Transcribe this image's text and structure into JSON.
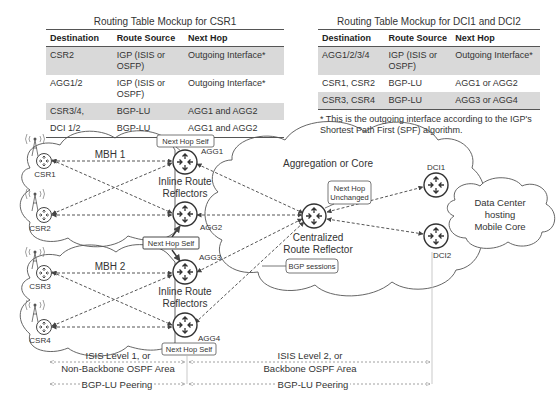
{
  "tables": [
    {
      "title": "Routing Table Mockup for CSR1",
      "headers": [
        "Destination",
        "Route Source",
        "Next Hop"
      ],
      "rows": [
        {
          "dest": "CSR2",
          "src": "IGP (ISIS or OSFP)",
          "hop": "Outgoing Interface*",
          "shaded": true
        },
        {
          "dest": "AGG1/2",
          "src": "IGP (ISIS or OSPF)",
          "hop": "Outgoing Interface*",
          "shaded": false
        },
        {
          "dest": "CSR3/4,",
          "src": "BGP-LU",
          "hop": "AGG1 and AGG2",
          "shaded": true
        },
        {
          "dest": "DCI 1/2",
          "src": "BGP-LU",
          "hop": "AGG1 and AGG2",
          "shaded": false
        }
      ]
    },
    {
      "title": "Routing Table Mockup for DCI1 and DCI2",
      "headers": [
        "Destination",
        "Route Source",
        "Next Hop"
      ],
      "rows": [
        {
          "dest": "AGG1/2/3/4",
          "src": "IGP (ISIS or OSPF)",
          "hop": "Outgoing Interface*",
          "shaded": true
        },
        {
          "dest": "CSR1, CSR2",
          "src": "BGP-LU",
          "hop": "AGG1 or AGG2",
          "shaded": false
        },
        {
          "dest": "CSR3, CSR4",
          "src": "BGP-LU",
          "hop": "AGG3 or AGG4",
          "shaded": true
        }
      ],
      "footnote": "* This is the outgoing interface according to the IGP's Shortest Path First (SPF) algorithm."
    }
  ],
  "diagram": {
    "clouds": {
      "mbh1": "MBH 1",
      "mbh2": "MBH 2",
      "core": "Aggregation or Core",
      "dc_line1": "Data Center",
      "dc_line2": "hosting",
      "dc_line3": "Mobile Core"
    },
    "nodes": {
      "csr1": "CSR1",
      "csr2": "CSR2",
      "csr3": "CSR3",
      "csr4": "CSR4",
      "agg1": "AGG1",
      "agg2": "AGG2",
      "agg3": "AGG3",
      "agg4": "AGG4",
      "dci1": "DCI1",
      "dci2": "DCI2"
    },
    "labels": {
      "inline_rr_top_1": "Inline Route",
      "inline_rr_top_2": "Reflectors",
      "inline_rr_bot_1": "Inline Route",
      "inline_rr_bot_2": "Reflectors",
      "central_rr_1": "Centralized",
      "central_rr_2": "Route Reflector"
    },
    "callouts": {
      "nhs_agg1": "Next Hop Self",
      "nhs_agg23": "Next Hop Self",
      "nhs_agg4": "Next Hop Self",
      "nh_unchanged_1": "Next Hop",
      "nh_unchanged_2": "Unchanged",
      "bgp_sessions": "BGP sessions"
    },
    "spans": {
      "isis_l1_line1": "ISIS Level 1, or",
      "isis_l1_line2": "Non-Backbone OSPF Area",
      "isis_l2_line1": "ISIS Level 2, or",
      "isis_l2_line2": "Backbone OSPF Area",
      "bgplu_left": "BGP-LU Peering",
      "bgplu_right": "BGP-LU Peering"
    }
  }
}
